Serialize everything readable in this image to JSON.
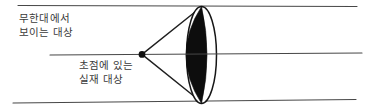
{
  "diagram": {
    "type": "optics-lens-ray-diagram",
    "labels": {
      "infinity_object": {
        "line1": "무한대에서",
        "line2": "보이는 대상"
      },
      "focal_object": {
        "line1": "초점에 있는",
        "line2": "실재 대상"
      }
    },
    "colors": {
      "background": "#ffffff",
      "ray_line": "#474747",
      "diverging_ray_line": "#1f1f1f",
      "lens_fill": "#0d0d0d",
      "lens_outline": "#161616",
      "focal_dot": "#101010",
      "text": "#3a3a3a"
    }
  }
}
